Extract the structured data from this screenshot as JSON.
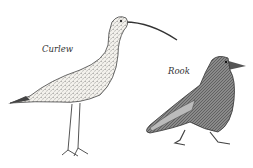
{
  "illustration": {
    "birds": [
      {
        "name": "Curlew",
        "label": "Curlew"
      },
      {
        "name": "Rook",
        "label": "Rook"
      }
    ],
    "colors": {
      "ink": "#333333",
      "background": "#ffffff",
      "rook_shade": "#777777"
    }
  }
}
